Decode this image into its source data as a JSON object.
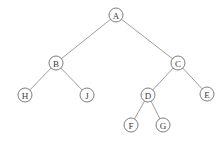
{
  "diagram": {
    "type": "binary-tree",
    "background_color": "#ffffff",
    "node_fill_color": "#ffffff",
    "node_stroke_color": "#6f6f6f",
    "edge_color": "#8d8d8d",
    "label_color": "#3a3a3a",
    "node_radius": 7,
    "nodes": [
      {
        "id": "A",
        "label": "A",
        "x": 116,
        "y": 15,
        "level": 0,
        "role": "root"
      },
      {
        "id": "B",
        "label": "B",
        "x": 56,
        "y": 63,
        "level": 1,
        "role": "internal"
      },
      {
        "id": "C",
        "label": "C",
        "x": 178,
        "y": 63,
        "level": 1,
        "role": "internal"
      },
      {
        "id": "H",
        "label": "H",
        "x": 25,
        "y": 95,
        "level": 2,
        "role": "leaf"
      },
      {
        "id": "J",
        "label": "J",
        "x": 87,
        "y": 95,
        "level": 2,
        "role": "leaf"
      },
      {
        "id": "D",
        "label": "D",
        "x": 148,
        "y": 95,
        "level": 2,
        "role": "internal"
      },
      {
        "id": "E",
        "label": "E",
        "x": 207,
        "y": 94,
        "level": 2,
        "role": "leaf"
      },
      {
        "id": "F",
        "label": "F",
        "x": 131,
        "y": 125,
        "level": 3,
        "role": "leaf"
      },
      {
        "id": "G",
        "label": "G",
        "x": 163,
        "y": 125,
        "level": 3,
        "role": "leaf"
      }
    ],
    "edges": [
      {
        "from": "A",
        "to": "B",
        "side": "left"
      },
      {
        "from": "A",
        "to": "C",
        "side": "right"
      },
      {
        "from": "B",
        "to": "H",
        "side": "left"
      },
      {
        "from": "B",
        "to": "J",
        "side": "right"
      },
      {
        "from": "C",
        "to": "D",
        "side": "left"
      },
      {
        "from": "C",
        "to": "E",
        "side": "right"
      },
      {
        "from": "D",
        "to": "F",
        "side": "left"
      },
      {
        "from": "D",
        "to": "G",
        "side": "right"
      }
    ]
  }
}
